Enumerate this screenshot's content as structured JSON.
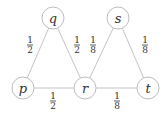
{
  "diagram": {
    "type": "weighted-graph",
    "nodes": [
      {
        "id": "q",
        "label": "q",
        "x": 53,
        "y": 18
      },
      {
        "id": "s",
        "label": "s",
        "x": 118,
        "y": 18
      },
      {
        "id": "p",
        "label": "p",
        "x": 23,
        "y": 88
      },
      {
        "id": "r",
        "label": "r",
        "x": 85,
        "y": 88
      },
      {
        "id": "t",
        "label": "t",
        "x": 148,
        "y": 88
      }
    ],
    "edges": [
      {
        "from": "q",
        "to": "p",
        "weight": {
          "num": "1",
          "den": "2"
        },
        "label_x": 30,
        "label_y": 45
      },
      {
        "from": "q",
        "to": "r",
        "weight": {
          "num": "1",
          "den": "2"
        },
        "label_x": 77,
        "label_y": 45
      },
      {
        "from": "s",
        "to": "r",
        "weight": {
          "num": "1",
          "den": "8"
        },
        "label_x": 93,
        "label_y": 45
      },
      {
        "from": "s",
        "to": "t",
        "weight": {
          "num": "1",
          "den": "8"
        },
        "label_x": 145,
        "label_y": 45
      },
      {
        "from": "p",
        "to": "r",
        "weight": {
          "num": "1",
          "den": "2"
        },
        "label_x": 53,
        "label_y": 101
      },
      {
        "from": "r",
        "to": "t",
        "weight": {
          "num": "1",
          "den": "8"
        },
        "label_x": 117,
        "label_y": 101
      }
    ],
    "node_radius": 11,
    "colors": {
      "stroke": "#bdbdbd",
      "text": "#333333"
    }
  }
}
